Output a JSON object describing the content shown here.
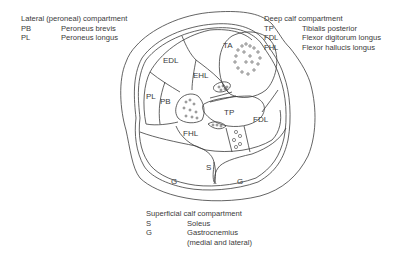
{
  "legends": {
    "lateral": {
      "title": "Lateral (peroneal) compartment",
      "items": [
        {
          "abbr": "PB",
          "name": "Peroneus brevis"
        },
        {
          "abbr": "PL",
          "name": "Peroneus longus"
        }
      ]
    },
    "deep": {
      "title": "Deep calf compartment",
      "items": [
        {
          "abbr": "TP",
          "name": "Tibialis posterior"
        },
        {
          "abbr": "FDL",
          "name": "Flexor digitorum longus"
        },
        {
          "abbr": "FHL",
          "name": "Flexor hallucis longus"
        }
      ]
    },
    "superficial": {
      "title": "Superficial calf compartment",
      "items": [
        {
          "abbr": "S",
          "name": "Soleus"
        },
        {
          "abbr": "G",
          "name": "Gastrocnemius"
        }
      ],
      "note": "(medial and lateral)"
    }
  },
  "diagram": {
    "labels": {
      "ta": "TA",
      "edl": "EDL",
      "ehl": "EHL",
      "pl": "PL",
      "pb": "PB",
      "tp": "TP",
      "fdl": "FDL",
      "fhl": "FHL",
      "s": "S",
      "g_left": "G",
      "g_right": "G"
    }
  }
}
